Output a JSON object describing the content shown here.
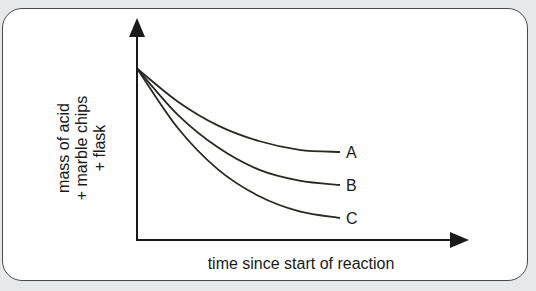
{
  "chart_data": {
    "type": "line",
    "title": "",
    "xlabel": "time since start of reaction",
    "ylabel_lines": [
      "mass of acid",
      "+ marble chips",
      "+ flask"
    ],
    "xlim": [
      0,
      1
    ],
    "ylim": [
      0,
      1
    ],
    "grid": false,
    "ticks": false,
    "legend": "inline-right",
    "series": [
      {
        "name": "A",
        "x": [
          0,
          0.2,
          0.4,
          0.6,
          0.8,
          1.0
        ],
        "values": [
          0.78,
          0.63,
          0.52,
          0.45,
          0.41,
          0.4
        ]
      },
      {
        "name": "B",
        "x": [
          0,
          0.2,
          0.4,
          0.6,
          0.8,
          1.0
        ],
        "values": [
          0.78,
          0.57,
          0.42,
          0.32,
          0.27,
          0.25
        ]
      },
      {
        "name": "C",
        "x": [
          0,
          0.2,
          0.4,
          0.6,
          0.8,
          1.0
        ],
        "values": [
          0.78,
          0.51,
          0.32,
          0.2,
          0.13,
          0.1
        ]
      }
    ]
  },
  "colors": {
    "line": "#2a2a22",
    "axis": "#1a1a1a",
    "background": "#e6e8ea",
    "panel": "#ffffff"
  }
}
